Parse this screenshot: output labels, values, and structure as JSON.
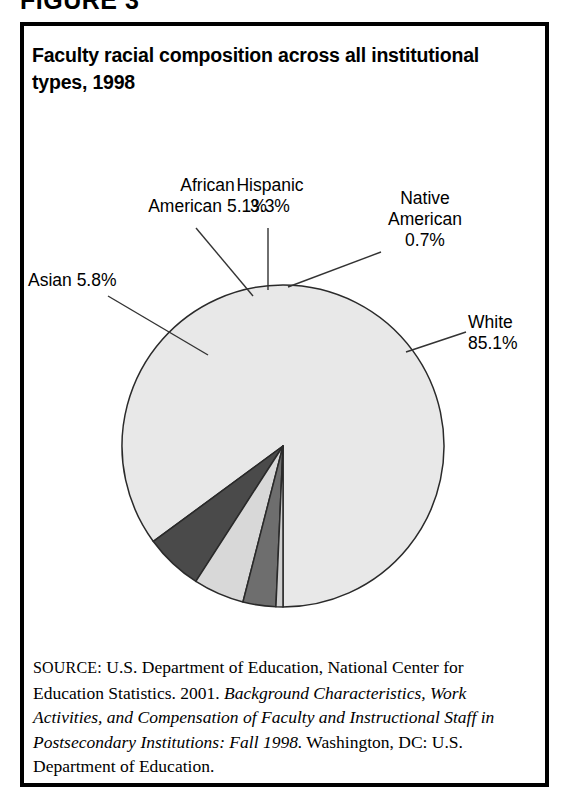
{
  "figure": {
    "label": "FIGURE 3",
    "title": "Faculty racial composition across all institutional types, 1998"
  },
  "chart_data": {
    "type": "pie",
    "title": "Faculty racial composition across all institutional types, 1998",
    "xlabel": "",
    "ylabel": "",
    "units": "percent",
    "legend_position": "callout-labels",
    "grid": false,
    "start_angle_deg": -90,
    "direction": "counterclockwise",
    "categories": [
      "White",
      "Asian",
      "African American",
      "Hispanic",
      "Native American"
    ],
    "values": [
      85.1,
      5.8,
      5.1,
      3.3,
      0.7
    ],
    "slices": [
      {
        "name": "White",
        "value": 85.1,
        "label": "White\n85.1%",
        "color": "#e8e8e8",
        "stroke": "#2a2a2a"
      },
      {
        "name": "Asian",
        "value": 5.8,
        "label": "Asian 5.8%",
        "color": "#4a4a4a",
        "stroke": "#2a2a2a"
      },
      {
        "name": "African American",
        "value": 5.1,
        "label": "African\nAmerican 5.1%",
        "color": "#d8d8d8",
        "stroke": "#2a2a2a"
      },
      {
        "name": "Hispanic",
        "value": 3.3,
        "label": "Hispanic\n3.3%",
        "color": "#6e6e6e",
        "stroke": "#2a2a2a"
      },
      {
        "name": "Native American",
        "value": 0.7,
        "label": "Native\nAmerican\n0.7%",
        "color": "#cfcfcf",
        "stroke": "#2a2a2a"
      }
    ]
  },
  "source": {
    "prefix": "SOURCE:",
    "text_1": " U.S. Department of Education, National Center for Education Statistics. 2001. ",
    "italic_1": "Background Characteristics, Work Activities, and Compensation of Faculty and Instructional Staff in Postsecondary Institutions: Fall 1998.",
    "text_2": " Washington, DC: U.S. Department of Education."
  },
  "colors": {
    "frame": "#000000",
    "text": "#000000",
    "background": "#ffffff",
    "leader_line": "#333333"
  }
}
